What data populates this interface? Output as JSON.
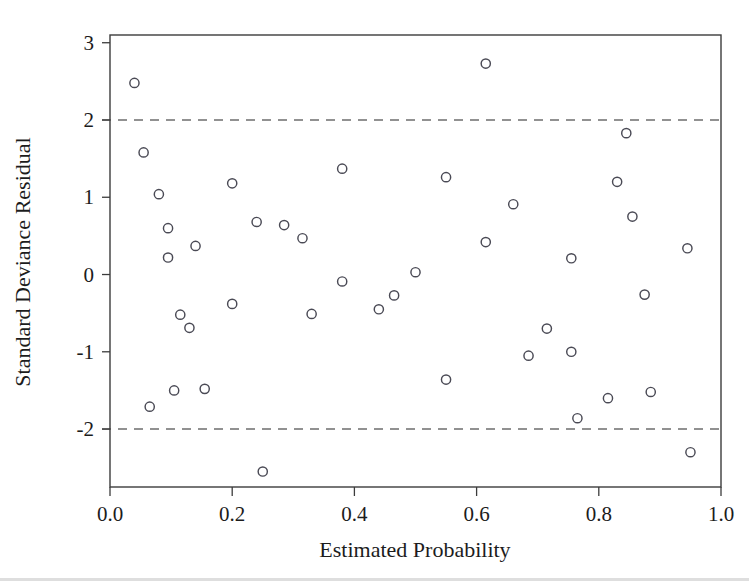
{
  "chart_data": {
    "type": "scatter",
    "title": "",
    "xlabel": "Estimated Probability",
    "ylabel": "Standard Deviance Residual",
    "xlim": [
      0.0,
      1.0
    ],
    "ylim": [
      -2.75,
      3.1
    ],
    "xticks": [
      0.0,
      0.2,
      0.4,
      0.6,
      0.8,
      1.0
    ],
    "xtick_labels": [
      "0.0",
      "0.2",
      "0.4",
      "0.6",
      "0.8",
      "1.0"
    ],
    "yticks": [
      3,
      2,
      1,
      0,
      -1,
      -2
    ],
    "ytick_labels": [
      "3",
      "2",
      "1",
      "0",
      "-1",
      "-2"
    ],
    "grid": false,
    "legend": null,
    "reference_lines": [
      {
        "name": "upper-2sd-line",
        "orientation": "horizontal",
        "y": 2,
        "style": "dashed"
      },
      {
        "name": "lower-2sd-line",
        "orientation": "horizontal",
        "y": -2,
        "style": "dashed"
      }
    ],
    "marker": {
      "shape": "open-circle",
      "radius": 4.6,
      "stroke": "#4a4a55",
      "fill": "none"
    },
    "series": [
      {
        "name": "deviance-residuals",
        "points": [
          [
            0.04,
            2.48
          ],
          [
            0.055,
            1.58
          ],
          [
            0.08,
            1.04
          ],
          [
            0.065,
            -1.71
          ],
          [
            0.095,
            0.6
          ],
          [
            0.095,
            0.22
          ],
          [
            0.105,
            -1.5
          ],
          [
            0.115,
            -0.52
          ],
          [
            0.13,
            -0.69
          ],
          [
            0.14,
            0.37
          ],
          [
            0.155,
            -1.48
          ],
          [
            0.2,
            1.18
          ],
          [
            0.2,
            -0.38
          ],
          [
            0.24,
            0.68
          ],
          [
            0.25,
            -2.55
          ],
          [
            0.285,
            0.64
          ],
          [
            0.315,
            0.47
          ],
          [
            0.33,
            -0.51
          ],
          [
            0.38,
            1.37
          ],
          [
            0.38,
            -0.09
          ],
          [
            0.44,
            -0.45
          ],
          [
            0.465,
            -0.27
          ],
          [
            0.5,
            0.03
          ],
          [
            0.55,
            1.26
          ],
          [
            0.55,
            -1.36
          ],
          [
            0.615,
            2.73
          ],
          [
            0.615,
            0.42
          ],
          [
            0.66,
            0.91
          ],
          [
            0.685,
            -1.05
          ],
          [
            0.715,
            -0.7
          ],
          [
            0.755,
            0.21
          ],
          [
            0.755,
            -1.0
          ],
          [
            0.765,
            -1.86
          ],
          [
            0.815,
            -1.6
          ],
          [
            0.83,
            1.2
          ],
          [
            0.845,
            1.83
          ],
          [
            0.855,
            0.75
          ],
          [
            0.875,
            -0.26
          ],
          [
            0.885,
            -1.52
          ],
          [
            0.945,
            0.34
          ],
          [
            0.95,
            -2.3
          ]
        ]
      }
    ]
  },
  "axes": {
    "x_title": "Estimated Probability",
    "y_title": "Standard Deviance Residual"
  },
  "colors": {
    "marker_stroke": "#4a4a55",
    "axis": "#3c3c3c",
    "reference": "#6e6e6e",
    "text": "#1c1c1c",
    "background": "#ffffff"
  }
}
